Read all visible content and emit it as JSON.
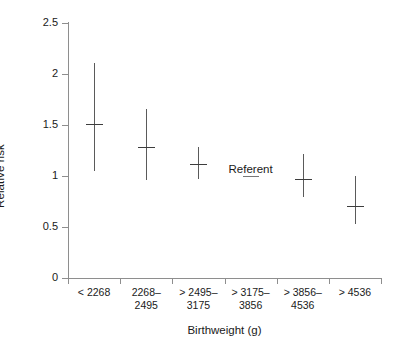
{
  "chart_data": {
    "type": "scatter",
    "title": "",
    "xlabel": "Birthweight (g)",
    "ylabel": "Relative risk",
    "ylim": [
      0,
      2.5
    ],
    "yticks": [
      0,
      0.5,
      1,
      1.5,
      2,
      2.5
    ],
    "ytick_labels": [
      "0",
      "0.5",
      "1",
      "1.5",
      "2",
      "2.5"
    ],
    "grid": false,
    "legend": "none",
    "categories": [
      "< 2268",
      "2268–\n2495",
      "> 2495–\n3175",
      "> 3175–\n3856",
      "> 3856–\n4536",
      "> 4536"
    ],
    "series": [
      {
        "name": "Relative risk",
        "points": [
          {
            "category": "< 2268",
            "value": 1.51,
            "ci_low": 1.05,
            "ci_high": 2.11,
            "referent": false
          },
          {
            "category": "2268–2495",
            "value": 1.28,
            "ci_low": 0.96,
            "ci_high": 1.66,
            "referent": false
          },
          {
            "category": "> 2495–3175",
            "value": 1.12,
            "ci_low": 0.97,
            "ci_high": 1.28,
            "referent": false
          },
          {
            "category": "> 3175–3856",
            "value": 1.0,
            "ci_low": null,
            "ci_high": null,
            "referent": true
          },
          {
            "category": "> 3856–4536",
            "value": 0.97,
            "ci_low": 0.79,
            "ci_high": 1.22,
            "referent": false
          },
          {
            "category": "> 4536",
            "value": 0.71,
            "ci_low": 0.53,
            "ci_high": 1.0,
            "referent": false
          }
        ]
      }
    ],
    "annotations": [
      {
        "text": "Referent",
        "category": "> 3175–3856",
        "value": 1.0
      }
    ],
    "colors": {
      "axis": "#8e8e8e",
      "marker": "#3d3d3d",
      "ci": "#5a5a5a",
      "text": "#1a1a1a",
      "background": "#ffffff"
    }
  },
  "axes": {
    "y_title": "Relative risk",
    "x_title": "Birthweight (g)",
    "y_tick_labels": [
      "2.5",
      "2",
      "1.5",
      "1",
      "0.5",
      "0"
    ],
    "x_tick_labels": [
      "< 2268",
      "2268–\n2495",
      "> 2495–\n3175",
      "> 3175–\n3856",
      "> 3856–\n4536",
      "> 4536"
    ]
  },
  "annotation": {
    "referent_label": "Referent"
  }
}
